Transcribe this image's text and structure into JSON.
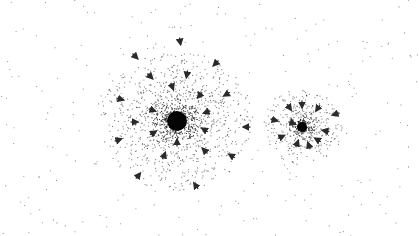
{
  "figure": {
    "width": 419,
    "height": 236,
    "background": "#ffffff",
    "particle_color": "#222222",
    "arrow_color": "#2a2a2a"
  },
  "background_field": {
    "count": 260,
    "seed": 7
  },
  "clusters": [
    {
      "name": "large-cluster",
      "cx": 177,
      "cy": 121,
      "core_radius": 10,
      "halo_radius": 70,
      "particle_count": 1400,
      "seed": 11,
      "arrows": [
        {
          "x": 135,
          "y": 56,
          "angle": 45
        },
        {
          "x": 180,
          "y": 41,
          "angle": 80
        },
        {
          "x": 216,
          "y": 63,
          "angle": 135
        },
        {
          "x": 150,
          "y": 76,
          "angle": 45
        },
        {
          "x": 187,
          "y": 74,
          "angle": 100
        },
        {
          "x": 227,
          "y": 94,
          "angle": 150
        },
        {
          "x": 172,
          "y": 86,
          "angle": 70
        },
        {
          "x": 200,
          "y": 95,
          "angle": 130
        },
        {
          "x": 152,
          "y": 110,
          "angle": 20
        },
        {
          "x": 207,
          "y": 112,
          "angle": 160
        },
        {
          "x": 120,
          "y": 99,
          "angle": 15
        },
        {
          "x": 134,
          "y": 122,
          "angle": 0
        },
        {
          "x": 247,
          "y": 127,
          "angle": 180
        },
        {
          "x": 118,
          "y": 140,
          "angle": -20
        },
        {
          "x": 153,
          "y": 133,
          "angle": -30
        },
        {
          "x": 205,
          "y": 130,
          "angle": -150
        },
        {
          "x": 177,
          "y": 143,
          "angle": -90
        },
        {
          "x": 164,
          "y": 156,
          "angle": -70
        },
        {
          "x": 205,
          "y": 151,
          "angle": -135
        },
        {
          "x": 232,
          "y": 156,
          "angle": -150
        },
        {
          "x": 138,
          "y": 176,
          "angle": -50
        },
        {
          "x": 196,
          "y": 186,
          "angle": -125
        }
      ]
    },
    {
      "name": "small-cluster",
      "cx": 302,
      "cy": 127,
      "core_radius": 5,
      "halo_radius": 38,
      "particle_count": 520,
      "seed": 23,
      "arrows": [
        {
          "x": 289,
          "y": 107,
          "angle": 55
        },
        {
          "x": 302,
          "y": 104,
          "angle": 90
        },
        {
          "x": 318,
          "y": 108,
          "angle": 125
        },
        {
          "x": 336,
          "y": 114,
          "angle": 160
        },
        {
          "x": 274,
          "y": 120,
          "angle": 15
        },
        {
          "x": 292,
          "y": 123,
          "angle": 20
        },
        {
          "x": 326,
          "y": 131,
          "angle": -170
        },
        {
          "x": 281,
          "y": 137,
          "angle": -25
        },
        {
          "x": 318,
          "y": 140,
          "angle": -150
        },
        {
          "x": 297,
          "y": 144,
          "angle": -70
        },
        {
          "x": 309,
          "y": 146,
          "angle": -110
        }
      ]
    }
  ]
}
